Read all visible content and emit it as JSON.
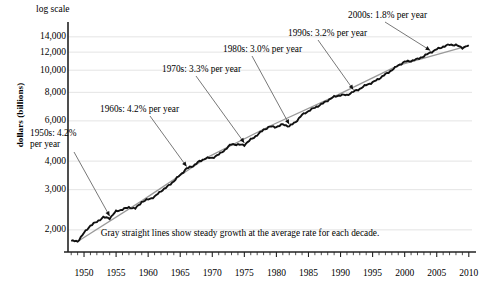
{
  "axes": {
    "y_title": "dollars (billions)",
    "scale_note": "log scale",
    "y_ticks": [
      "14,000",
      "12,000",
      "10,000",
      "8,000",
      "6,000",
      "4,000",
      "3,000",
      "2,000"
    ],
    "x_ticks": [
      "1950",
      "1955",
      "1960",
      "1965",
      "1970",
      "1975",
      "1980",
      "1985",
      "1990",
      "1995",
      "2000",
      "2005",
      "2010"
    ]
  },
  "caption": "Gray straight lines show steady growth at the average rate for each decade.",
  "annotations": [
    {
      "id": "a1950s",
      "line1": "1950s: 4.2%",
      "line2": "per year"
    },
    {
      "id": "a1960s",
      "line1": "1960s: 4.2% per year",
      "line2": ""
    },
    {
      "id": "a1970s",
      "line1": "1970s: 3.3% per year",
      "line2": ""
    },
    {
      "id": "a1980s",
      "line1": "1980s: 3.0% per year",
      "line2": ""
    },
    {
      "id": "a1990s",
      "line1": "1990s: 3.2% per year",
      "line2": ""
    },
    {
      "id": "a2000s",
      "line1": "2000s: 1.8% per year",
      "line2": ""
    }
  ],
  "colors": {
    "series_line": "#111111",
    "trend_line": "#9a9a9a",
    "grid": "#d8d8d8",
    "axis": "#222222"
  },
  "chart_data": {
    "type": "line",
    "title": "",
    "subtitle": "",
    "xlabel": "",
    "ylabel": "dollars (billions)",
    "yscale": "log",
    "ylim": [
      1600,
      15000
    ],
    "xlim": [
      1947.5,
      2010.5
    ],
    "grid": true,
    "legend": "none",
    "ytick_values": [
      14000,
      12000,
      10000,
      8000,
      6000,
      4000,
      3000,
      2000
    ],
    "xtick_values": [
      1950,
      1955,
      1960,
      1965,
      1970,
      1975,
      1980,
      1985,
      1990,
      1995,
      2000,
      2005,
      2010
    ],
    "annotations": [
      {
        "text": "1950s: 4.2% per year",
        "decade": "1950s",
        "rate_pct": 4.2,
        "points_to_year": 1954
      },
      {
        "text": "1960s: 4.2% per year",
        "decade": "1960s",
        "rate_pct": 4.2,
        "points_to_year": 1966
      },
      {
        "text": "1970s: 3.3% per year",
        "decade": "1970s",
        "rate_pct": 3.3,
        "points_to_year": 1975
      },
      {
        "text": "1980s: 3.0% per year",
        "decade": "1980s",
        "rate_pct": 3.0,
        "points_to_year": 1982
      },
      {
        "text": "1990s: 3.2% per year",
        "decade": "1990s",
        "rate_pct": 3.2,
        "points_to_year": 1992
      },
      {
        "text": "2000s: 1.8% per year",
        "decade": "2000s",
        "rate_pct": 1.8,
        "points_to_year": 2004
      }
    ],
    "series": [
      {
        "name": "Real GDP",
        "style": "solid-black-jagged",
        "x": [
          1948,
          1949,
          1950,
          1951,
          1952,
          1953,
          1954,
          1955,
          1956,
          1957,
          1958,
          1959,
          1960,
          1961,
          1962,
          1963,
          1964,
          1965,
          1966,
          1967,
          1968,
          1969,
          1970,
          1971,
          1972,
          1973,
          1974,
          1975,
          1976,
          1977,
          1978,
          1979,
          1980,
          1981,
          1982,
          1983,
          1984,
          1985,
          1986,
          1987,
          1988,
          1989,
          1990,
          1991,
          1992,
          1993,
          1994,
          1995,
          1996,
          1997,
          1998,
          1999,
          2000,
          2001,
          2002,
          2003,
          2004,
          2005,
          2006,
          2007,
          2008,
          2009,
          2010
        ],
        "y": [
          1790,
          1780,
          1940,
          2090,
          2170,
          2270,
          2250,
          2410,
          2460,
          2510,
          2480,
          2650,
          2720,
          2790,
          2960,
          3090,
          3270,
          3480,
          3710,
          3810,
          3990,
          4120,
          4130,
          4270,
          4490,
          4750,
          4720,
          4710,
          4970,
          5200,
          5490,
          5660,
          5650,
          5790,
          5680,
          5940,
          6370,
          6630,
          6860,
          7090,
          7380,
          7650,
          7790,
          7780,
          8050,
          8280,
          8620,
          8840,
          9180,
          9590,
          10010,
          10500,
          10890,
          10990,
          11190,
          11520,
          11960,
          12340,
          12680,
          12940,
          12890,
          12530,
          12860
        ]
      },
      {
        "name": "Decade trend lines",
        "style": "straight-gray-segments",
        "segments": [
          {
            "decade": "1950s",
            "x": [
              1949,
              1959
            ],
            "y": [
              1780,
              2680
            ],
            "rate_pct": 4.2
          },
          {
            "decade": "1960s",
            "x": [
              1959,
              1969
            ],
            "y": [
              2680,
              4120
            ],
            "rate_pct": 4.2
          },
          {
            "decade": "1970s",
            "x": [
              1969,
              1979
            ],
            "y": [
              4120,
              5700
            ],
            "rate_pct": 3.3
          },
          {
            "decade": "1980s",
            "x": [
              1979,
              1989
            ],
            "y": [
              5700,
              7660
            ],
            "rate_pct": 3.0
          },
          {
            "decade": "1990s",
            "x": [
              1989,
              1999
            ],
            "y": [
              7660,
              10500
            ],
            "rate_pct": 3.2
          },
          {
            "decade": "2000s",
            "x": [
              1999,
              2010
            ],
            "y": [
              10500,
              12800
            ],
            "rate_pct": 1.8
          }
        ]
      }
    ]
  }
}
